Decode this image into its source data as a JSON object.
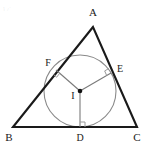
{
  "figure": {
    "kind": "euclidean-geometry-diagram",
    "width": 155,
    "height": 154,
    "background_color": "#ffffff"
  },
  "colors": {
    "triangle_stroke": "#1a1a1a",
    "circle_stroke": "#8a8a8a",
    "radius_stroke": "#7a7a7a",
    "right_angle_stroke": "#9a9a9a",
    "center_dot": "#111111",
    "label_text": "#1a1a1a",
    "watermark": "#555555"
  },
  "labels": {
    "vertex_a": "A",
    "vertex_b": "B",
    "vertex_c": "C",
    "point_d": "D",
    "point_e": "E",
    "point_f": "F",
    "center_i": "I"
  },
  "geometry": {
    "triangle": {
      "a": {
        "x": 93,
        "y": 27
      },
      "b": {
        "x": 13,
        "y": 127
      },
      "c": {
        "x": 137,
        "y": 127
      },
      "stroke_width": 2.1
    },
    "incircle": {
      "cx": 80,
      "cy": 91,
      "r": 36,
      "stroke_width": 1.1
    },
    "tangent_points": {
      "d": {
        "x": 80,
        "y": 127
      },
      "e": {
        "x": 111,
        "y": 73
      },
      "f": {
        "x": 56,
        "y": 70
      }
    },
    "center": {
      "x": 80,
      "y": 91
    },
    "center_dot_radius": 2.3,
    "radii_stroke_width": 1.1,
    "right_angle_size": 5
  },
  "label_positions": {
    "a": {
      "x": 93,
      "y": 16
    },
    "b": {
      "x": 9,
      "y": 141
    },
    "c": {
      "x": 137,
      "y": 141
    },
    "d": {
      "x": 80,
      "y": 141
    },
    "e": {
      "x": 120,
      "y": 72
    },
    "f": {
      "x": 48,
      "y": 66
    },
    "i": {
      "x": 73,
      "y": 99
    }
  },
  "watermark": {
    "text": "☞"
  }
}
